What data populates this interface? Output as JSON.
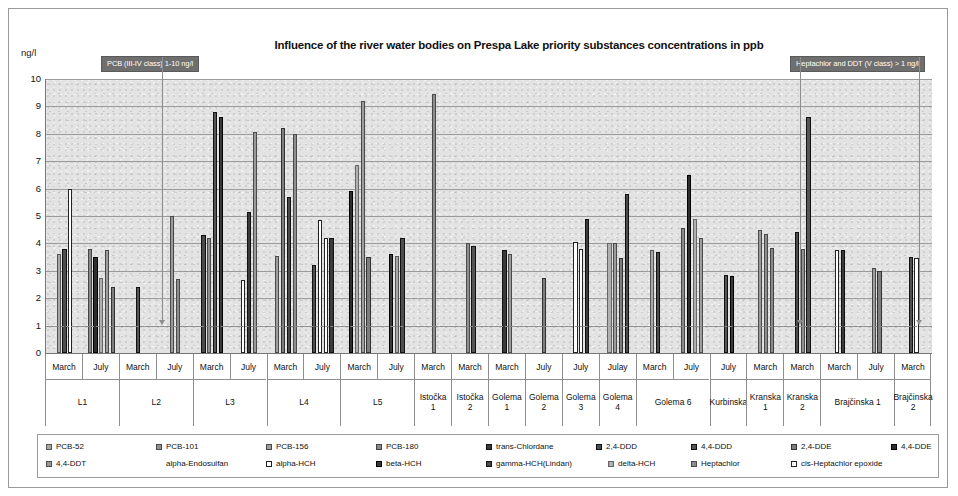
{
  "chart_data": {
    "type": "bar",
    "title": "Influence of the river water bodies on Prespa Lake priority substances concentrations in ppb",
    "xlabel": "",
    "ylabel": "ng/l",
    "ylim": [
      0,
      10
    ],
    "yticks": [
      0,
      1,
      2,
      3,
      4,
      5,
      6,
      7,
      8,
      9,
      10
    ],
    "grid": true,
    "legend_position": "bottom",
    "threshold_line": {
      "value": 1,
      "style": "dashed",
      "label": "1 ng/l"
    },
    "annotations": [
      {
        "text": "PCB (III-IV class) 1-10 ng/l",
        "points_to_value": 1
      },
      {
        "text": "Heptachlor and DDT (V class) > 1 ng/l",
        "points_to_value": 1
      }
    ],
    "series_names": [
      "PCB-52",
      "PCB-101",
      "PCB-156",
      "PCB-180",
      "trans-Chlordane",
      "2,4-DDD",
      "4,4-DDD",
      "2,4-DDE",
      "4,4-DDE",
      "4,4-DDT",
      "alpha-Endosulfan",
      "alpha-HCH",
      "beta-HCH",
      "gamma-HCH(Lindan)",
      "delta-HCH",
      "Heptachlor",
      "cis-Heptachlor epoxide"
    ],
    "groups": [
      {
        "site": "L1",
        "period": "March",
        "bars": [
          3.6,
          3.8,
          6.0
        ]
      },
      {
        "site": "L1",
        "period": "July",
        "bars": [
          3.8,
          3.5,
          2.75,
          3.75,
          2.4
        ]
      },
      {
        "site": "L2",
        "period": "March",
        "bars": [
          2.4
        ]
      },
      {
        "site": "L2",
        "period": "July",
        "bars": [
          5.0,
          2.7
        ]
      },
      {
        "site": "L3",
        "period": "March",
        "bars": [
          4.3,
          4.2,
          8.8,
          8.6
        ]
      },
      {
        "site": "L3",
        "period": "July",
        "bars": [
          2.65,
          5.15,
          8.05
        ]
      },
      {
        "site": "L4",
        "period": "March",
        "bars": [
          3.55,
          8.2,
          5.7,
          8.0
        ]
      },
      {
        "site": "L4",
        "period": "July",
        "bars": [
          3.2,
          4.85,
          4.2,
          4.2
        ]
      },
      {
        "site": "L5",
        "period": "March",
        "bars": [
          5.9,
          6.85,
          9.2,
          3.5
        ]
      },
      {
        "site": "L5",
        "period": "July",
        "bars": [
          3.6,
          3.55,
          4.2
        ]
      },
      {
        "site": "Istočka 1",
        "period": "March",
        "bars": [
          9.45
        ]
      },
      {
        "site": "Istočka 2",
        "period": "March",
        "bars": [
          4.0,
          3.9
        ]
      },
      {
        "site": "Golema 1",
        "period": "March",
        "bars": [
          3.75,
          3.6
        ]
      },
      {
        "site": "Golema 2",
        "period": "July",
        "bars": [
          2.75
        ]
      },
      {
        "site": "Golema 3",
        "period": "July",
        "bars": [
          4.05,
          3.8,
          4.9
        ]
      },
      {
        "site": "Golema 4",
        "period": "Julay",
        "bars": [
          4.0,
          4.0,
          3.45,
          5.8
        ]
      },
      {
        "site": "Golema 6",
        "period": "March",
        "bars": [
          3.75,
          3.7
        ]
      },
      {
        "site": "Golema 6",
        "period": "July",
        "bars": [
          4.55,
          6.5,
          4.9,
          4.2
        ]
      },
      {
        "site": "Kurbinska",
        "period": "July",
        "bars": [
          2.85,
          2.8
        ]
      },
      {
        "site": "Kranska 1",
        "period": "March",
        "bars": [
          4.5,
          4.35,
          3.85
        ]
      },
      {
        "site": "Kranska 2",
        "period": "March",
        "bars": [
          4.4,
          3.8,
          8.6
        ]
      },
      {
        "site": "Brajčinska 1",
        "period": "March",
        "bars": [
          3.75,
          3.75
        ]
      },
      {
        "site": "Brajčinska 1",
        "period": "July",
        "bars": [
          3.1,
          3.0
        ]
      },
      {
        "site": "Brajčinska 2",
        "period": "March",
        "bars": [
          3.5,
          3.45
        ]
      }
    ],
    "x_group_labels": [
      {
        "label": "L1",
        "span": 2
      },
      {
        "label": "L2",
        "span": 2
      },
      {
        "label": "L3",
        "span": 2
      },
      {
        "label": "L4",
        "span": 2
      },
      {
        "label": "L5",
        "span": 2
      },
      {
        "label": "Istočka 1",
        "span": 1
      },
      {
        "label": "Istočka 2",
        "span": 1
      },
      {
        "label": "Golema 1",
        "span": 1
      },
      {
        "label": "Golema 2",
        "span": 1
      },
      {
        "label": "Golema 3",
        "span": 1
      },
      {
        "label": "Golema 4",
        "span": 1
      },
      {
        "label": "Golema 6",
        "span": 2
      },
      {
        "label": "Kurbinska",
        "span": 1
      },
      {
        "label": "Kranska 1",
        "span": 1
      },
      {
        "label": "Kranska 2",
        "span": 1
      },
      {
        "label": "Brajčinska 1",
        "span": 2
      },
      {
        "label": "Brajčinska 2",
        "span": 1
      }
    ],
    "period_labels": [
      "March",
      "July",
      "March",
      "July",
      "March",
      "July",
      "March",
      "July",
      "March",
      "July",
      "March",
      "March",
      "March",
      "July",
      "July",
      "Julay",
      "March",
      "July",
      "July",
      "March",
      "March",
      "March",
      "July",
      "March"
    ]
  },
  "legend": {
    "row1": [
      {
        "label": "PCB-52",
        "color": "#a8a8a8",
        "border": "#555555"
      },
      {
        "label": "PCB-101",
        "color": "#8f8f8f",
        "border": "#4a4a4a"
      },
      {
        "label": "PCB-156",
        "color": "#9d9d9d",
        "border": "#4a4a4a"
      },
      {
        "label": "PCB-180",
        "color": "#8a8a8a",
        "border": "#444444"
      },
      {
        "label": "trans-Chlordane",
        "color": "#3a3a3a",
        "border": "#111111"
      },
      {
        "label": "2,4-DDD",
        "color": "#4e4e4e",
        "border": "#111111"
      },
      {
        "label": "4,4-DDD",
        "color": "#555555",
        "border": "#111111"
      },
      {
        "label": "2,4-DDE",
        "color": "#7d7d7d",
        "border": "#333333"
      },
      {
        "label": "4,4-DDE",
        "color": "#2e2e2e",
        "border": "#000000"
      }
    ],
    "row2": [
      {
        "label": "4,4-DDT",
        "color": "#9a9a9a",
        "border": "#4a4a4a"
      },
      {
        "label": "alpha-Endosulfan",
        "color": "#ffffff",
        "border": "#ffffff"
      },
      {
        "label": "alpha-HCH",
        "color": "#ffffff",
        "border": "#222222"
      },
      {
        "label": "beta-HCH",
        "color": "#3a3a3a",
        "border": "#000000"
      },
      {
        "label": "gamma-HCH(Lindan)",
        "color": "#4a4a4a",
        "border": "#111111"
      },
      {
        "label": "delta-HCH",
        "color": "#b0b0b0",
        "border": "#666666"
      },
      {
        "label": "Heptachlor",
        "color": "#8d8d8d",
        "border": "#4a4a4a"
      },
      {
        "label": "cis-Heptachlor epoxide",
        "color": "#ffffff",
        "border": "#222222"
      }
    ]
  },
  "colors": {
    "plot_background": "#e3e3e3",
    "gridline": "#9b9b9b",
    "callout_background": "#6f6f6f",
    "callout_text": "#ffffff",
    "axis": "#777777",
    "frame": "#9a9a9a"
  }
}
